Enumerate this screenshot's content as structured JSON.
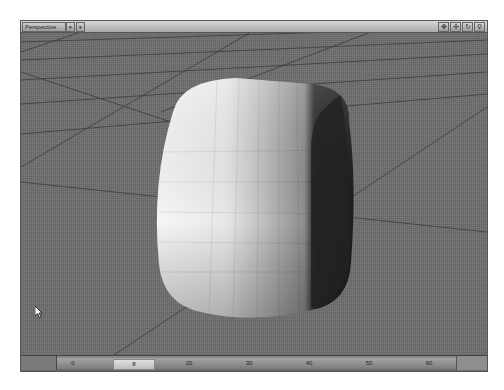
{
  "viewport": {
    "view_mode": "Perspective",
    "dropdown_glyph": "▾",
    "options_glyph": "▾",
    "nav_icons": [
      {
        "name": "move-view-icon",
        "glyph": "✥"
      },
      {
        "name": "rotate-view-icon",
        "glyph": "✣"
      },
      {
        "name": "rotate-view-icon-alt",
        "glyph": "↻"
      },
      {
        "name": "zoom-view-icon",
        "glyph": "⚲"
      }
    ]
  },
  "scene": {
    "object": "subdivided rounded cube",
    "ground_color": "#6e6e6e",
    "grid_line_color": "#3a3a3a"
  },
  "timeline": {
    "current_frame": "8",
    "ticks": [
      {
        "label": "0",
        "x_pct": 4
      },
      {
        "label": "20",
        "x_pct": 33
      },
      {
        "label": "30",
        "x_pct": 48
      },
      {
        "label": "40",
        "x_pct": 63
      },
      {
        "label": "50",
        "x_pct": 78
      },
      {
        "label": "60",
        "x_pct": 93
      }
    ]
  }
}
